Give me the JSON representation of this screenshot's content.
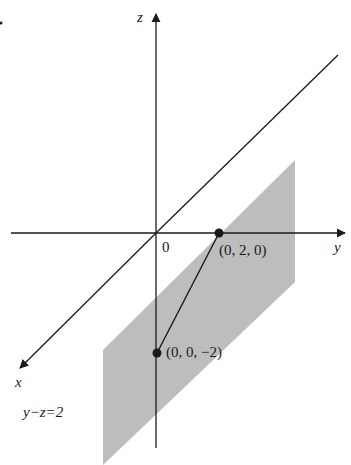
{
  "figure": {
    "axes": {
      "x_label": "x",
      "y_label": "y",
      "z_label": "z",
      "origin_label": "0"
    },
    "points": [
      {
        "label": "(0, 2, 0)",
        "coords": [
          0,
          2,
          0
        ]
      },
      {
        "label": "(0, 0, −2)",
        "coords": [
          0,
          0,
          -2
        ]
      }
    ],
    "plane_label": "y−z=2",
    "colors": {
      "plane_fill": "#bdbdbd",
      "line": "#1a1a1a",
      "background": "#ffffff"
    }
  }
}
